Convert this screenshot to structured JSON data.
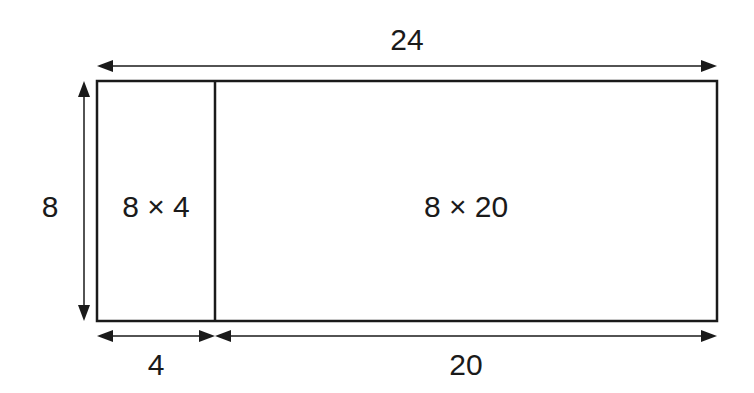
{
  "diagram": {
    "total_width_label": "24",
    "height_label": "8",
    "left_width_label": "4",
    "right_width_label": "20",
    "left_area_label": "8 × 4",
    "right_area_label": "8 × 20",
    "stroke_color": "#1a1a1a"
  }
}
